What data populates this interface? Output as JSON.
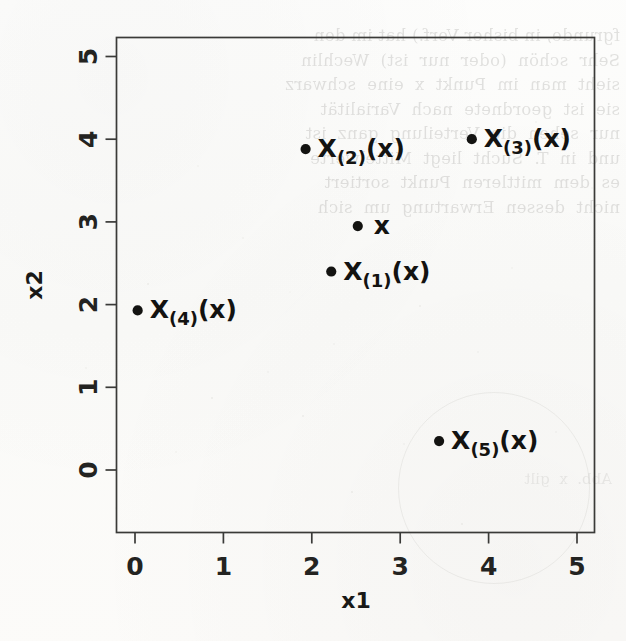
{
  "figure": {
    "kind": "scatter-plot",
    "background_color": "#fcfcfb",
    "ink_color": "#131311",
    "axis_color": "#3a3a38"
  },
  "axes": {
    "x_title": "x1",
    "y_title": "x2",
    "x_ticks": [
      "0",
      "1",
      "2",
      "3",
      "4",
      "5"
    ],
    "y_ticks": [
      "0",
      "1",
      "2",
      "3",
      "4",
      "5"
    ]
  },
  "scan_artifacts": {
    "bleed_text": "fgrunde, in bisher Verf.) hat im den\nSehr  schön  (oder  nur  ist)  Wechlin\nsieht  man  im  Punkt  x  eine  schwarz\nsie  ist  geordnete  nach  Varialität\nnur  sehen  die  Verteilung  ganz  ist\nund  in  T.  Sucht  liegt  Mittelwerte\nes  dem  mittleren  Punkt  sortiert\nnicht  dessen  Erwartung  um  sich",
    "bleed_text_2": "Abb.  x  gilt"
  },
  "chart_data": {
    "type": "scatter",
    "title": "",
    "xlabel": "x1",
    "ylabel": "x2",
    "xlim": [
      -0.2,
      5.2
    ],
    "ylim": [
      -0.25,
      5.2
    ],
    "xticks": [
      0,
      1,
      2,
      3,
      4,
      5
    ],
    "yticks": [
      0,
      1,
      2,
      3,
      4,
      5
    ],
    "grid": false,
    "legend": null,
    "points": [
      {
        "label": "x",
        "x": 2.52,
        "x2": 2.95,
        "label_dx": 16,
        "label_dy": 8,
        "is_query": true
      },
      {
        "label": "X(1)(x)",
        "x": 2.22,
        "x2": 2.4,
        "label_dx": 12,
        "label_dy": 8,
        "sub": "1"
      },
      {
        "label": "X(2)(x)",
        "x": 1.93,
        "x2": 3.88,
        "label_dx": 12,
        "label_dy": 8,
        "sub": "2"
      },
      {
        "label": "X(3)(x)",
        "x": 3.81,
        "x2": 4.0,
        "label_dx": 12,
        "label_dy": 8,
        "sub": "3"
      },
      {
        "label": "X(4)(x)",
        "x": 0.03,
        "x2": 1.93,
        "label_dx": 12,
        "label_dy": 8,
        "sub": "4"
      },
      {
        "label": "X(5)(x)",
        "x": 3.44,
        "x2": 0.35,
        "label_dx": 12,
        "label_dy": 8,
        "sub": "5"
      }
    ],
    "point_labels": [
      "x",
      "X(1)(x)",
      "X(2)(x)",
      "X(3)(x)",
      "X(4)(x)",
      "X(5)(x)"
    ]
  }
}
